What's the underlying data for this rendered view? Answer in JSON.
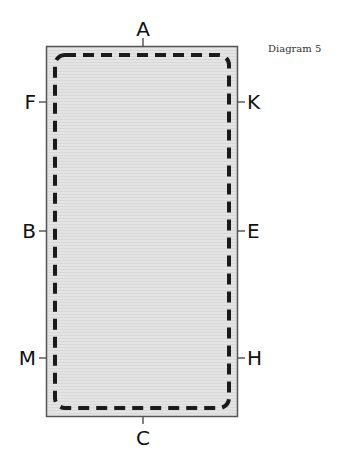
{
  "caption": "Diagram 5",
  "diagram": {
    "shape": "rectangle",
    "fill_color": "#e2e2e2",
    "border_color": "#555555",
    "dash_color": "#1a1a1a",
    "labels": {
      "top": "A",
      "bottom": "C",
      "left_upper": "F",
      "left_middle": "B",
      "left_lower": "M",
      "right_upper": "K",
      "right_middle": "E",
      "right_lower": "H"
    }
  }
}
